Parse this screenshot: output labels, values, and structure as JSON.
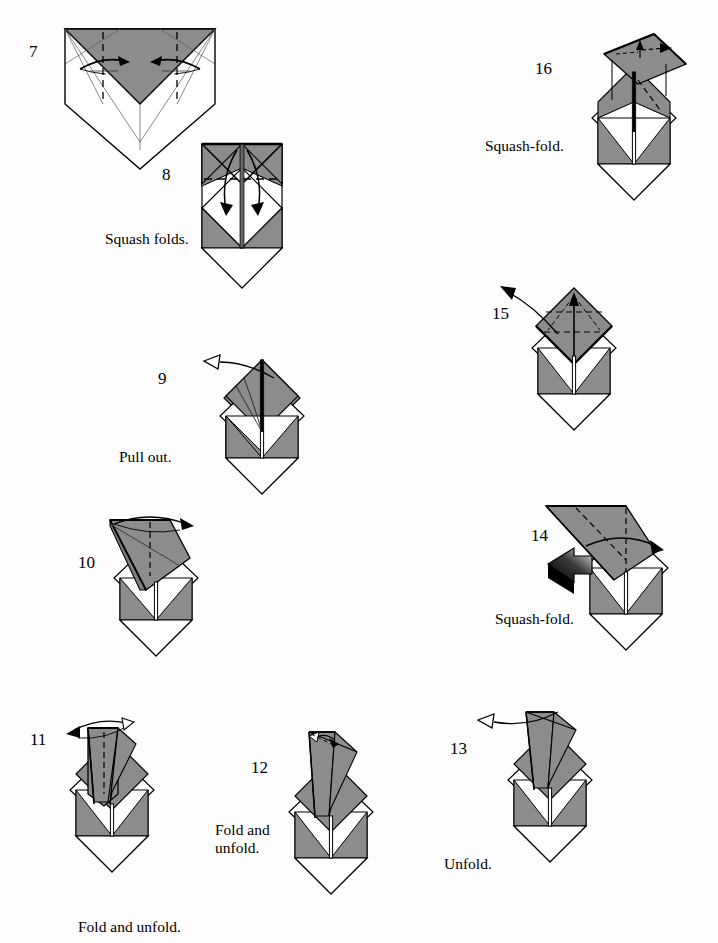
{
  "document": {
    "type": "origami-folding-instructions",
    "page_background": "#fdfdfd",
    "ink_color": "#000000",
    "paper_front_color": "#8c8c8c",
    "paper_back_color": "#ffffff",
    "paper_shadow_color": "#6f6f6f"
  },
  "steps": [
    {
      "id": "step-7",
      "number": "7",
      "caption": "",
      "number_pos": {
        "x": 29,
        "y": 43
      },
      "figure_pos": {
        "x": 60,
        "y": 24
      },
      "figure_size": {
        "w": 150,
        "h": 142
      },
      "shape": "pentagon-with-gray-vee",
      "arrows": [
        "inward-pair"
      ],
      "creases": [
        "dashed-vertical-pair",
        "valley-x-marks",
        "center-line"
      ]
    },
    {
      "id": "step-8",
      "number": "8",
      "caption": "Squash folds.",
      "number_pos": {
        "x": 162,
        "y": 166
      },
      "caption_pos": {
        "x": 105,
        "y": 230
      },
      "figure_pos": {
        "x": 198,
        "y": 142
      },
      "figure_size": {
        "w": 82,
        "h": 172
      },
      "shape": "body-with-flat-top",
      "arrows": [
        "double-down-curve"
      ],
      "creases": [
        "dashed-horizontal"
      ]
    },
    {
      "id": "step-9",
      "number": "9",
      "caption": "Pull out.",
      "number_pos": {
        "x": 158,
        "y": 370
      },
      "caption_pos": {
        "x": 119,
        "y": 448
      },
      "figure_pos": {
        "x": 222,
        "y": 357
      },
      "figure_size": {
        "w": 82,
        "h": 152
      },
      "shape": "body-with-gray-diamond-top",
      "arrows": [
        "pull-out-hollow-up-left"
      ],
      "creases": [
        "center-spine"
      ]
    },
    {
      "id": "step-10",
      "number": "10",
      "caption": "",
      "number_pos": {
        "x": 78,
        "y": 554
      },
      "figure_pos": {
        "x": 95,
        "y": 518
      },
      "figure_size": {
        "w": 82,
        "h": 152
      },
      "shape": "body-with-folded-flap-left",
      "arrows": [
        "swing-right-curve"
      ],
      "creases": [
        "dashed-vertical-flap"
      ]
    },
    {
      "id": "step-11",
      "number": "11",
      "caption": "Fold and unfold.",
      "number_pos": {
        "x": 30,
        "y": 731
      },
      "caption_pos": {
        "x": 78,
        "y": 918
      },
      "figure_pos": {
        "x": 60,
        "y": 722
      },
      "figure_size": {
        "w": 82,
        "h": 160
      },
      "shape": "body-with-narrow-flap",
      "arrows": [
        "fold-unfold-left"
      ],
      "creases": [
        "dashed-vertical-flap"
      ]
    },
    {
      "id": "step-12",
      "number": "12",
      "caption": "Fold and\nunfold.",
      "number_pos": {
        "x": 251,
        "y": 759
      },
      "caption_pos": {
        "x": 215,
        "y": 822
      },
      "figure_pos": {
        "x": 277,
        "y": 734
      },
      "figure_size": {
        "w": 82,
        "h": 160
      },
      "shape": "body-with-small-flap",
      "arrows": [
        "small-double-arrow"
      ],
      "creases": [
        "dashed-short"
      ]
    },
    {
      "id": "step-13",
      "number": "13",
      "caption": "Unfold.",
      "number_pos": {
        "x": 450,
        "y": 740
      },
      "caption_pos": {
        "x": 444,
        "y": 855
      },
      "figure_pos": {
        "x": 491,
        "y": 712
      },
      "figure_size": {
        "w": 82,
        "h": 160
      },
      "shape": "body-with-narrow-flap",
      "arrows": [
        "unfold-hollow-left"
      ],
      "creases": []
    },
    {
      "id": "step-14",
      "number": "14",
      "caption": "Squash-fold.",
      "number_pos": {
        "x": 531,
        "y": 527
      },
      "caption_pos": {
        "x": 495,
        "y": 610
      },
      "figure_pos": {
        "x": 563,
        "y": 510
      },
      "figure_size": {
        "w": 82,
        "h": 160
      },
      "shape": "body-with-wide-gray-flap",
      "arrows": [
        "swing-right-curve",
        "black-push-arrow"
      ],
      "creases": [
        "dashed-vertical"
      ]
    },
    {
      "id": "step-15",
      "number": "15",
      "caption": "",
      "number_pos": {
        "x": 492,
        "y": 305
      },
      "figure_pos": {
        "x": 525,
        "y": 288
      },
      "figure_size": {
        "w": 82,
        "h": 152
      },
      "shape": "body-with-gray-diamond-top",
      "arrows": [
        "pull-out-up-left",
        "small-up-arrow"
      ],
      "creases": [
        "dashed-cross"
      ]
    },
    {
      "id": "step-16",
      "number": "16",
      "caption": "Squash-fold.",
      "number_pos": {
        "x": 535,
        "y": 60
      },
      "caption_pos": {
        "x": 485,
        "y": 137
      },
      "figure_pos": {
        "x": 573,
        "y": 42
      },
      "figure_size": {
        "w": 82,
        "h": 160
      },
      "shape": "body-with-tilted-gray-flap",
      "arrows": [
        "small-up-arrow",
        "small-right-arrow"
      ],
      "creases": [
        "dashed-diagonal"
      ]
    }
  ],
  "labels": {
    "squash_folds": "Squash folds.",
    "squash_fold": "Squash-fold.",
    "pull_out": "Pull out.",
    "fold_and_unfold": "Fold and unfold.",
    "fold_and_unfold_wrapped": "Fold and\nunfold.",
    "unfold": "Unfold."
  }
}
